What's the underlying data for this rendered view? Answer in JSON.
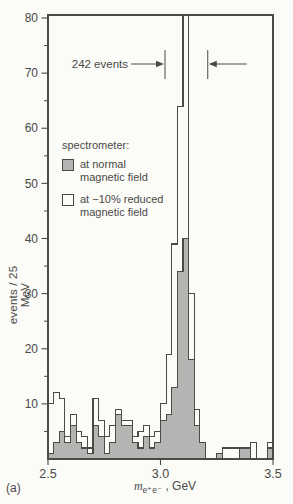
{
  "figure": {
    "panel_label": "(a)",
    "background": "#fbfbf8",
    "ink_color": "#4a4a48",
    "shaded_fill_color": "#b4b4b2"
  },
  "legend": {
    "title": "spectrometer:",
    "items": [
      {
        "swatch": "filled-gray",
        "label": "at normal\nmagnetic field"
      },
      {
        "swatch": "open-white",
        "label": "at −10% reduced\nmagnetic field"
      }
    ]
  },
  "annotation": {
    "text": "242 events",
    "from_gev": 3.02,
    "to_gev": 3.21
  },
  "axes": {
    "y_title": "events / 25 MeV",
    "x_title_prefix": "m",
    "x_title_sub": "e⁺e⁻",
    "x_title_suffix": " , GeV",
    "y_range": [
      0,
      80
    ],
    "y_major_ticks": [
      10,
      20,
      30,
      40,
      50,
      60,
      70,
      80
    ],
    "y_minor_ticks": [
      5,
      15,
      25,
      35,
      45,
      55,
      65,
      75
    ],
    "x_range": [
      2.5,
      3.5
    ],
    "x_ticks": [
      2.5,
      3.0,
      3.5
    ],
    "x_tick_labels": [
      "2.5",
      "3.0",
      "3.5"
    ]
  },
  "chart_data": {
    "type": "bar",
    "subtype": "step-histogram",
    "title": "",
    "xlabel": "m(e+e−), GeV",
    "ylabel": "events / 25 MeV",
    "xlim": [
      2.5,
      3.5
    ],
    "ylim": [
      0,
      80
    ],
    "grid": false,
    "legend_position": "upper-left-inside",
    "bin_width_gev": 0.025,
    "x_start_gev": 2.5,
    "bin_left_edges_gev": [
      2.5,
      2.525,
      2.55,
      2.575,
      2.6,
      2.625,
      2.65,
      2.675,
      2.7,
      2.725,
      2.75,
      2.775,
      2.8,
      2.825,
      2.85,
      2.875,
      2.9,
      2.925,
      2.95,
      2.975,
      3.0,
      3.025,
      3.05,
      3.075,
      3.1,
      3.125,
      3.15,
      3.175,
      3.2,
      3.225,
      3.25,
      3.275,
      3.3,
      3.325,
      3.35,
      3.375,
      3.4,
      3.425,
      3.45,
      3.475
    ],
    "series": [
      {
        "name": "at normal magnetic field",
        "style": "filled-gray",
        "values": [
          1,
          3,
          5,
          3,
          6,
          3,
          2,
          1,
          6,
          4,
          1,
          3,
          8,
          6,
          6,
          3,
          2,
          4,
          2,
          3,
          7,
          8,
          13,
          34,
          40,
          18,
          6,
          3,
          0,
          0,
          1,
          0,
          0,
          0,
          2,
          2,
          0,
          0,
          0,
          2
        ]
      },
      {
        "name": "at −10% reduced magnetic field",
        "style": "open-outline",
        "values": [
          10,
          12,
          11,
          4,
          8,
          5,
          4,
          2,
          11,
          7,
          4,
          6,
          9,
          7,
          7,
          4,
          5,
          6,
          4,
          5,
          10,
          19,
          39,
          64,
          86,
          30,
          9,
          3,
          0,
          0,
          0,
          2,
          2,
          2,
          0,
          0,
          3,
          0,
          0,
          3
        ],
        "offscale_bin": {
          "index": 24,
          "bin_gev": "3.100–3.125",
          "display": ">80",
          "note": "peak bin drawn clipped above the 80-events axis maximum"
        }
      }
    ]
  }
}
